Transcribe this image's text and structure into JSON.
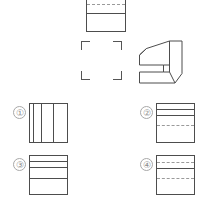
{
  "page": {
    "width": 207,
    "height": 205,
    "background": "#ffffff",
    "line_color": "#4d4d4d",
    "hidden_line_color": "#9a9a9a",
    "label_color": "#8c8c8c"
  },
  "given_view": {
    "name": "top-orthographic-view",
    "x": 86,
    "y": -6,
    "w": 40,
    "h": 38,
    "lines": [
      {
        "type": "horizontal",
        "style": "dashed",
        "pos_pct": 26
      },
      {
        "type": "horizontal",
        "style": "solid",
        "pos_pct": 50
      }
    ]
  },
  "placeholder": {
    "name": "missing-view-placeholder",
    "x": 81,
    "y": 41,
    "w": 41,
    "h": 39,
    "corner_len": 8
  },
  "solid_object": {
    "name": "isometric-solid",
    "x": 138,
    "y": 39,
    "w": 45,
    "h": 46,
    "description": "C-shaped block in isometric projection"
  },
  "options": [
    {
      "id": 1,
      "label": "①",
      "num_x": 13,
      "num_y": 106,
      "box_x": 29,
      "box_y": 103,
      "box_w": 39,
      "box_h": 40,
      "lines": [
        {
          "type": "vertical",
          "style": "solid",
          "pos_pct": 8
        },
        {
          "type": "vertical",
          "style": "solid",
          "pos_pct": 30
        },
        {
          "type": "vertical",
          "style": "solid",
          "pos_pct": 62
        }
      ]
    },
    {
      "id": 2,
      "label": "②",
      "num_x": 140,
      "num_y": 106,
      "box_x": 156,
      "box_y": 103,
      "box_w": 39,
      "box_h": 40,
      "lines": [
        {
          "type": "horizontal",
          "style": "solid",
          "pos_pct": 14
        },
        {
          "type": "horizontal",
          "style": "solid",
          "pos_pct": 30
        },
        {
          "type": "horizontal",
          "style": "dashed",
          "pos_pct": 56
        }
      ]
    },
    {
      "id": 3,
      "label": "③",
      "num_x": 13,
      "num_y": 158,
      "box_x": 29,
      "box_y": 155,
      "box_w": 39,
      "box_h": 40,
      "lines": [
        {
          "type": "horizontal",
          "style": "solid",
          "pos_pct": 14
        },
        {
          "type": "horizontal",
          "style": "solid",
          "pos_pct": 30
        },
        {
          "type": "horizontal",
          "style": "solid",
          "pos_pct": 58
        }
      ]
    },
    {
      "id": 4,
      "label": "④",
      "num_x": 140,
      "num_y": 158,
      "box_x": 156,
      "box_y": 155,
      "box_w": 39,
      "box_h": 40,
      "lines": [
        {
          "type": "horizontal",
          "style": "dashed",
          "pos_pct": 16
        },
        {
          "type": "horizontal",
          "style": "solid",
          "pos_pct": 32
        },
        {
          "type": "horizontal",
          "style": "dashed",
          "pos_pct": 58
        }
      ]
    }
  ]
}
